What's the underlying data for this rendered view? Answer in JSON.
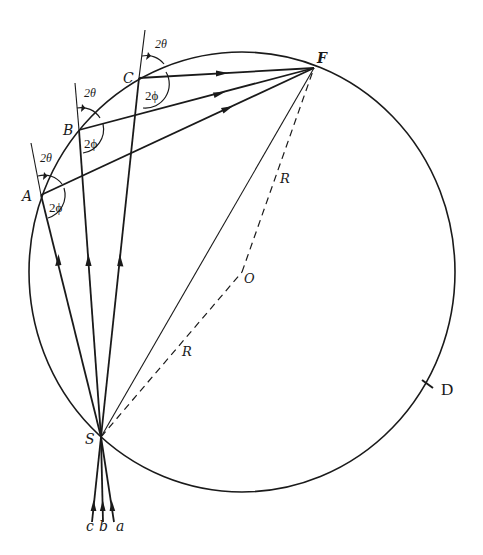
{
  "diagram": {
    "type": "geometric-optics / focusing circle (Rowland-type)",
    "circle": {
      "center_label": "O",
      "radius_label": "R"
    },
    "points": {
      "A": "A",
      "B": "B",
      "C": "C",
      "F": "F",
      "S": "S",
      "O": "O",
      "D": "D"
    },
    "incident_rays": [
      "c",
      "b",
      "a"
    ],
    "angle_labels": {
      "theta": "2θ",
      "phi": "2ϕ"
    },
    "radius_labels": [
      "R",
      "R"
    ],
    "colors": {
      "ink": "#1a1a1a",
      "background": "#ffffff"
    }
  }
}
